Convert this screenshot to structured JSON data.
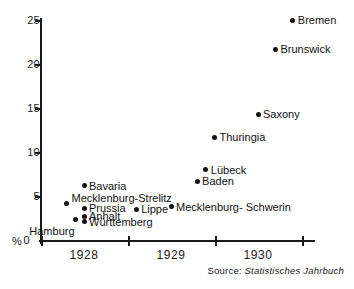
{
  "chart_data": {
    "type": "scatter",
    "title": "",
    "xlabel": "",
    "ylabel": "%",
    "xlim": [
      1927.6,
      1930.7
    ],
    "ylim": [
      0,
      25
    ],
    "grid": false,
    "legend": "none",
    "x_ticks": [
      "1928",
      "1929",
      "1930"
    ],
    "x_tick_values": [
      1928,
      1929,
      1930
    ],
    "y_ticks": [
      "0",
      "5",
      "10",
      "15",
      "20",
      "25"
    ],
    "y_tick_values": [
      0,
      5,
      10,
      15,
      20,
      25
    ],
    "y_unit": "%",
    "points": [
      {
        "label": "Bremen",
        "x": 1930.4,
        "y": 25.1,
        "label_side": "right"
      },
      {
        "label": "Brunswick",
        "x": 1930.2,
        "y": 21.8,
        "label_side": "right"
      },
      {
        "label": "Saxony",
        "x": 1930.0,
        "y": 14.4,
        "label_side": "right"
      },
      {
        "label": "Thuringia",
        "x": 1929.5,
        "y": 11.8,
        "label_side": "right"
      },
      {
        "label": "Lübeck",
        "x": 1929.4,
        "y": 8.1,
        "label_side": "right"
      },
      {
        "label": "Baden",
        "x": 1929.3,
        "y": 6.8,
        "label_side": "right"
      },
      {
        "label": "Mecklenburg- Schwerin",
        "x": 1929.0,
        "y": 3.9,
        "label_side": "right"
      },
      {
        "label": "Lippe",
        "x": 1928.6,
        "y": 3.6,
        "label_side": "right"
      },
      {
        "label": "Bavaria",
        "x": 1928.0,
        "y": 6.3,
        "label_side": "right"
      },
      {
        "label": "Mecklenburg-Strelitz",
        "x": 1927.8,
        "y": 4.3,
        "label_side": "right-above"
      },
      {
        "label": "Hamburg",
        "x": 1927.9,
        "y": 2.5,
        "label_side": "below"
      },
      {
        "label": "Prussia",
        "x": 1928.0,
        "y": 3.7,
        "label_side": "right"
      },
      {
        "label": "Anhalt",
        "x": 1928.0,
        "y": 2.8,
        "label_side": "right"
      },
      {
        "label": "Württemberg",
        "x": 1928.0,
        "y": 2.2,
        "label_side": "right"
      }
    ]
  },
  "source": {
    "prefix": "Source:",
    "title": "Statistisches Jahrbuch"
  }
}
